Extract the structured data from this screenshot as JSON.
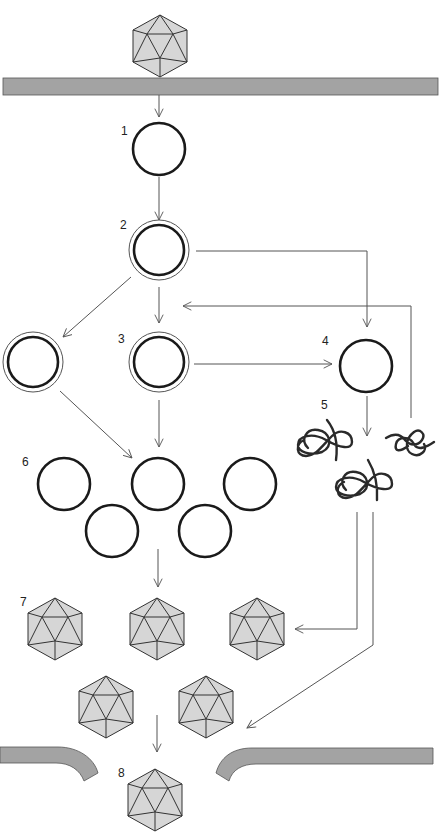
{
  "diagram": {
    "colors": {
      "membrane_fill": "#a3a3a3",
      "capsid_fill": "#d6d6d6",
      "line": "#555555",
      "outline": "#1a1a1a"
    },
    "step_labels": [
      "1",
      "2",
      "3",
      "4",
      "5",
      "6",
      "7",
      "8"
    ],
    "icons": {
      "virion": "icosahedral-capsid-icon",
      "genome": "circle-genome-icon",
      "double_genome": "double-circle-genome-icon",
      "protein": "tangled-protein-icon",
      "membrane": "cell-membrane-bar"
    }
  }
}
